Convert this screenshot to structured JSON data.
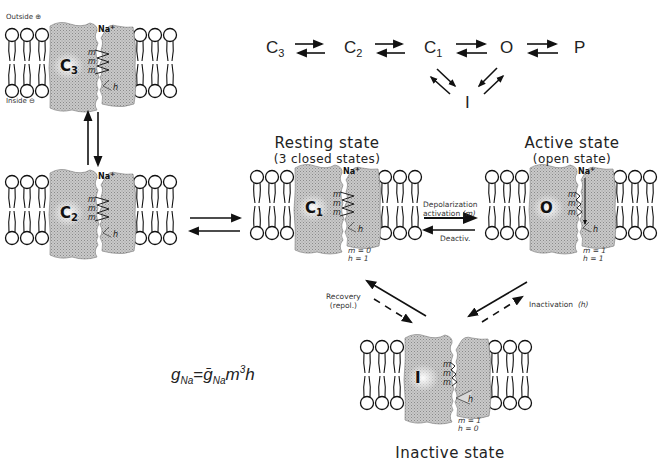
{
  "kinetic_scheme": {
    "states": [
      {
        "label": "C",
        "sub": "3"
      },
      {
        "label": "C",
        "sub": "2"
      },
      {
        "label": "C",
        "sub": "1"
      },
      {
        "label": "O",
        "sub": ""
      },
      {
        "label": "P",
        "sub": ""
      }
    ],
    "inactivated_label": "I"
  },
  "membrane_labels": {
    "outside": "Outside ⊕",
    "inside": "Inside ⊖"
  },
  "ion_label": "Na+",
  "ion_symbol": "Na",
  "ion_charge": "+",
  "gate_m": "m",
  "gate_h": "h",
  "channels": [
    {
      "id": "c3",
      "state_label": "C",
      "state_sub": "3",
      "x": 5,
      "y": 28,
      "open": false,
      "inactivated": false,
      "gate_values": null
    },
    {
      "id": "c2",
      "state_label": "C",
      "state_sub": "2",
      "x": 5,
      "y": 175,
      "open": false,
      "inactivated": false,
      "gate_values": null
    },
    {
      "id": "c1",
      "state_label": "C",
      "state_sub": "1",
      "x": 250,
      "y": 170,
      "open": false,
      "inactivated": false,
      "gate_values": {
        "m": "m = 0",
        "h": "h = 1"
      }
    },
    {
      "id": "o",
      "state_label": "O",
      "state_sub": "",
      "x": 485,
      "y": 170,
      "open": true,
      "inactivated": false,
      "gate_values": {
        "m": "m = 1",
        "h": "h = 1"
      }
    },
    {
      "id": "i",
      "state_label": "I",
      "state_sub": "",
      "x": 360,
      "y": 340,
      "open": true,
      "inactivated": true,
      "gate_values": {
        "m": "m = 1",
        "h": "h = 0"
      }
    }
  ],
  "states": {
    "resting": {
      "title": "Resting state",
      "subtitle": "(3 closed states)"
    },
    "active": {
      "title": "Active state",
      "subtitle": "(open state)"
    },
    "inactive": {
      "title": "Inactive state"
    }
  },
  "transitions": {
    "depolarization": "Depolarization",
    "activation": "activation",
    "activation_gate": "(m)",
    "deactivation": "Deactiv.",
    "recovery": "Recovery",
    "recovery_sub": "(repol.)",
    "inactivation": "Inactivation",
    "inactivation_gate": "(h)"
  },
  "formula": {
    "lhs": "g",
    "lhs_sub": "Na",
    "eq": "=",
    "rhs_g": "ḡ",
    "rhs_sub": "Na",
    "rhs_m": "m",
    "rhs_exp": "3",
    "rhs_h": "h"
  }
}
